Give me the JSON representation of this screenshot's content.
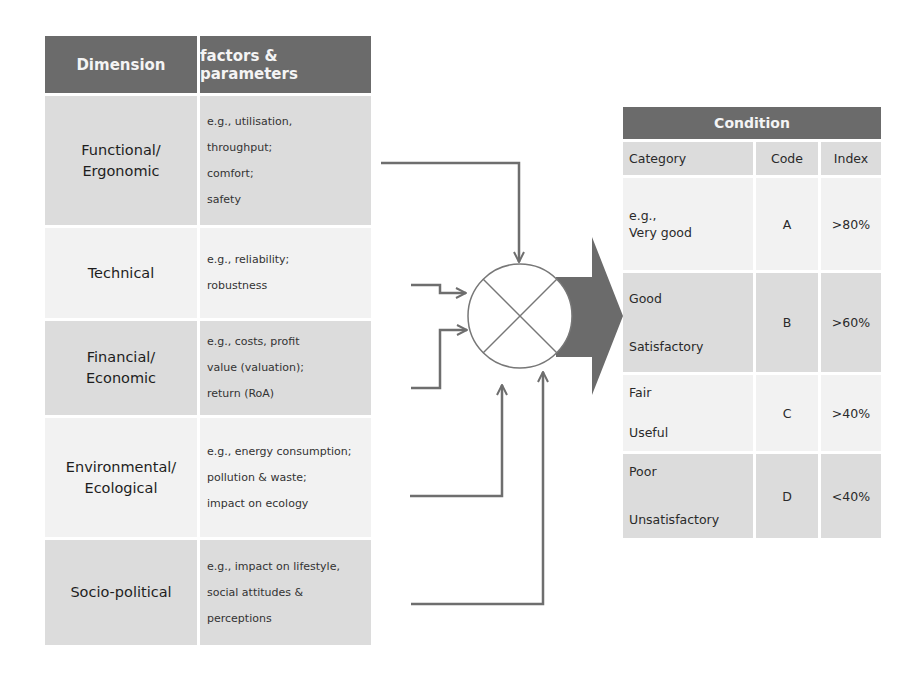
{
  "dimensions_table": {
    "headers": [
      "Dimension",
      "factors & parameters"
    ],
    "rows": [
      {
        "dimension": [
          "Functional/",
          "Ergonomic"
        ],
        "factors": [
          "e.g., utilisation,",
          "throughput;",
          "comfort;",
          "safety"
        ]
      },
      {
        "dimension": [
          "Technical"
        ],
        "factors": [
          "e.g., reliability;",
          "robustness"
        ]
      },
      {
        "dimension": [
          "Financial/",
          "Economic"
        ],
        "factors": [
          "e.g., costs, profit",
          "value (valuation);",
          "return (RoA)"
        ]
      },
      {
        "dimension": [
          "Environmental/",
          "Ecological"
        ],
        "factors": [
          "e.g., energy consumption;",
          "pollution  & waste;",
          "impact on ecology"
        ]
      },
      {
        "dimension": [
          "Socio-political"
        ],
        "factors": [
          "e.g., impact on lifestyle,",
          "social attitudes &",
          "perceptions"
        ]
      }
    ]
  },
  "aggregation_node": {
    "symbol": "circle-with-cross",
    "output": "arrow-right"
  },
  "condition_table": {
    "title": "Condition",
    "headers": [
      "Category",
      "Code",
      "Index"
    ],
    "rows": [
      {
        "category": [
          "e.g.,",
          "Very good"
        ],
        "code": "A",
        "index": ">80%"
      },
      {
        "category": [
          "Good",
          "Satisfactory"
        ],
        "code": "B",
        "index": ">60%"
      },
      {
        "category": [
          "Fair",
          "Useful"
        ],
        "code": "C",
        "index": ">40%"
      },
      {
        "category": [
          "Poor",
          "Unsatisfactory"
        ],
        "code": "D",
        "index": "<40%"
      }
    ]
  },
  "colors": {
    "header": "#6b6b6b",
    "row_dark": "#dcdcdc",
    "row_light": "#f2f2f2",
    "connector": "#6e6e6e",
    "arrow": "#6b6b6b"
  }
}
